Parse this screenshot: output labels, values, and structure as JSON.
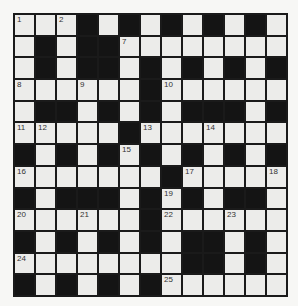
{
  "puzzle": {
    "type": "crossword",
    "rows": 13,
    "cols": 13,
    "colors": {
      "block": "#141414",
      "cell": "#ececea",
      "lines": "#1a1a1a",
      "background": "#f7f7f5"
    },
    "grid": [
      "...#.#.#.#.#.",
      ".#.##........",
      ".#.##.#.#.#.#",
      "......#......",
      ".##.#.#.###.#",
      ".....#.......",
      "#.#.#.#.#.#.#",
      ".......#.....",
      "#.###.#.#.##.",
      "......#......",
      "#.#.#.#.##.#.",
      "........##.#.",
      "#.#.#.#......"
    ],
    "numbers": [
      {
        "row": 0,
        "col": 0,
        "n": "1"
      },
      {
        "row": 0,
        "col": 2,
        "n": "2"
      },
      {
        "row": 0,
        "col": 5,
        "n": "3"
      },
      {
        "row": 0,
        "col": 7,
        "n": "4"
      },
      {
        "row": 0,
        "col": 9,
        "n": "5"
      },
      {
        "row": 0,
        "col": 11,
        "n": "6"
      },
      {
        "row": 1,
        "col": 5,
        "n": "7"
      },
      {
        "row": 3,
        "col": 0,
        "n": "8"
      },
      {
        "row": 3,
        "col": 3,
        "n": "9"
      },
      {
        "row": 3,
        "col": 7,
        "n": "10"
      },
      {
        "row": 5,
        "col": 0,
        "n": "11"
      },
      {
        "row": 5,
        "col": 1,
        "n": "12"
      },
      {
        "row": 5,
        "col": 6,
        "n": "13"
      },
      {
        "row": 5,
        "col": 9,
        "n": "14"
      },
      {
        "row": 6,
        "col": 5,
        "n": "15"
      },
      {
        "row": 7,
        "col": 0,
        "n": "16"
      },
      {
        "row": 7,
        "col": 8,
        "n": "17"
      },
      {
        "row": 7,
        "col": 12,
        "n": "18"
      },
      {
        "row": 8,
        "col": 7,
        "n": "19"
      },
      {
        "row": 9,
        "col": 0,
        "n": "20"
      },
      {
        "row": 9,
        "col": 3,
        "n": "21"
      },
      {
        "row": 9,
        "col": 7,
        "n": "22"
      },
      {
        "row": 9,
        "col": 10,
        "n": "23"
      },
      {
        "row": 11,
        "col": 0,
        "n": "24"
      },
      {
        "row": 12,
        "col": 7,
        "n": "25"
      }
    ]
  }
}
